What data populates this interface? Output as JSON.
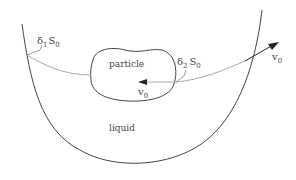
{
  "diagram": {
    "labels": {
      "particle": "particle",
      "liquid": "liquid",
      "delta1": "δ",
      "delta1_sub": "1",
      "delta1_S": "S",
      "delta1_S_sub": "0",
      "delta2": "δ",
      "delta2_sub": "2",
      "delta2_S": "S",
      "delta2_S_sub": "0",
      "v_inner": "v",
      "v_inner_sub": "0",
      "v_outer": "v",
      "v_outer_sub": "0"
    },
    "colors": {
      "outline": "#444444",
      "path": "#aaaaaa",
      "arrow": "#222222",
      "background": "#ffffff"
    }
  }
}
